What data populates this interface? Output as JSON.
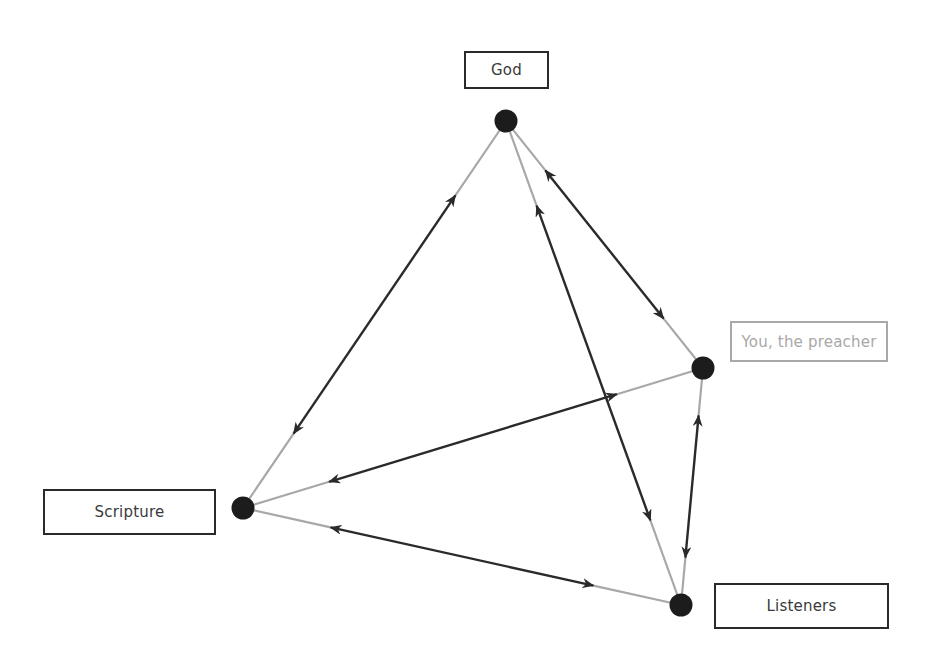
{
  "diagram": {
    "type": "tetrahedral relationship diagram",
    "colors": {
      "node": "#1c1c1c",
      "arrow": "#2a2a2a",
      "line_near_node": "#a8a8a8",
      "box_border": "#2a2a2a",
      "muted": "#a8a8a8"
    },
    "nodes": [
      {
        "id": "god",
        "label": "God",
        "x": 506,
        "y": 121,
        "muted": false
      },
      {
        "id": "preacher",
        "label": "You, the preacher",
        "x": 703,
        "y": 368,
        "muted": true
      },
      {
        "id": "scripture",
        "label": "Scripture",
        "x": 243,
        "y": 508,
        "muted": false
      },
      {
        "id": "listeners",
        "label": "Listeners",
        "x": 681,
        "y": 605,
        "muted": false
      }
    ],
    "labels": {
      "god": "God",
      "preacher": "You, the preacher",
      "scripture": "Scripture",
      "listeners": "Listeners"
    },
    "edges": [
      {
        "from": "god",
        "to": "scripture",
        "direction": "bidirectional"
      },
      {
        "from": "god",
        "to": "preacher",
        "direction": "bidirectional"
      },
      {
        "from": "god",
        "to": "listeners",
        "direction": "bidirectional"
      },
      {
        "from": "preacher",
        "to": "scripture",
        "direction": "bidirectional"
      },
      {
        "from": "preacher",
        "to": "listeners",
        "direction": "bidirectional"
      },
      {
        "from": "scripture",
        "to": "listeners",
        "direction": "bidirectional"
      }
    ]
  }
}
